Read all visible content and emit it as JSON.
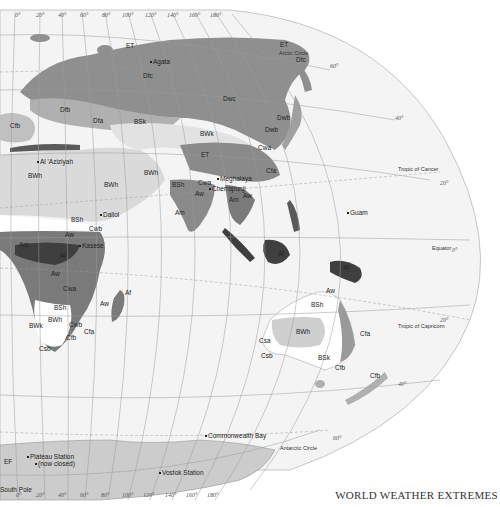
{
  "title": "WORLD WEATHER EXTREMES",
  "colors": {
    "ocean": "#f2f2f2",
    "graticule": "#9a9a9a",
    "D_cold": "#8f8f8f",
    "C_temperate": "#b9b9b9",
    "B_dry_hot": "#d9d9d9",
    "B_steppe": "#ffffff",
    "A_savanna": "#7a7a7a",
    "A_rainforest": "#3f3f3f",
    "E_polar": "#c8c8c8"
  },
  "graticule": {
    "top_longitudes": [
      "0°",
      "20°",
      "40°",
      "60°",
      "80°",
      "100°",
      "120°",
      "140°",
      "160°",
      "180°"
    ],
    "bottom_longitudes": [
      "0°",
      "20°",
      "40°",
      "60°",
      "80°",
      "100°",
      "120°",
      "140°",
      "160°",
      "180°"
    ],
    "latitudes": [
      "60°",
      "40°",
      "20°",
      "0°",
      "20°",
      "40°",
      "60°"
    ]
  },
  "reference_lines": {
    "arctic_circle": "Arctic Circle",
    "tropic_cancer": "Tropic of Cancer",
    "equator": "Equator",
    "tropic_capricorn": "Tropic of Capricorn",
    "antarctic_circle": "Antarctic Circle"
  },
  "climate_labels": [
    {
      "code": "ET",
      "x": 126,
      "y": 48
    },
    {
      "code": "ET",
      "x": 280,
      "y": 47
    },
    {
      "code": "Dfc",
      "x": 143,
      "y": 78
    },
    {
      "code": "Dfc",
      "x": 296,
      "y": 62
    },
    {
      "code": "Dwc",
      "x": 223,
      "y": 101
    },
    {
      "code": "Dwb",
      "x": 277,
      "y": 120
    },
    {
      "code": "Dwb",
      "x": 265,
      "y": 132
    },
    {
      "code": "Cwa",
      "x": 258,
      "y": 150
    },
    {
      "code": "Cfa",
      "x": 266,
      "y": 173
    },
    {
      "code": "Dfb",
      "x": 60,
      "y": 112
    },
    {
      "code": "Dfa",
      "x": 93,
      "y": 123
    },
    {
      "code": "BSk",
      "x": 134,
      "y": 124
    },
    {
      "code": "BWk",
      "x": 200,
      "y": 136
    },
    {
      "code": "Cfb",
      "x": 10,
      "y": 128
    },
    {
      "code": "BWh",
      "x": 28,
      "y": 178
    },
    {
      "code": "BWh",
      "x": 104,
      "y": 187
    },
    {
      "code": "BWh",
      "x": 144,
      "y": 175
    },
    {
      "code": "ET",
      "x": 201,
      "y": 157
    },
    {
      "code": "BSh",
      "x": 172,
      "y": 187
    },
    {
      "code": "Cwa",
      "x": 198,
      "y": 185
    },
    {
      "code": "Aw",
      "x": 195,
      "y": 196
    },
    {
      "code": "Aw",
      "x": 243,
      "y": 198
    },
    {
      "code": "Am",
      "x": 175,
      "y": 215
    },
    {
      "code": "Am",
      "x": 229,
      "y": 202
    },
    {
      "code": "BSh",
      "x": 71,
      "y": 222
    },
    {
      "code": "Aw",
      "x": 65,
      "y": 237
    },
    {
      "code": "Cwb",
      "x": 89,
      "y": 231
    },
    {
      "code": "Am",
      "x": 19,
      "y": 247
    },
    {
      "code": "Af",
      "x": 60,
      "y": 258
    },
    {
      "code": "Aw",
      "x": 51,
      "y": 276
    },
    {
      "code": "Cwa",
      "x": 63,
      "y": 291
    },
    {
      "code": "Af",
      "x": 125,
      "y": 295
    },
    {
      "code": "Aw",
      "x": 100,
      "y": 306
    },
    {
      "code": "BSh",
      "x": 54,
      "y": 310
    },
    {
      "code": "BWh",
      "x": 48,
      "y": 322
    },
    {
      "code": "BWk",
      "x": 29,
      "y": 328
    },
    {
      "code": "Cwb",
      "x": 69,
      "y": 327
    },
    {
      "code": "Cfa",
      "x": 84,
      "y": 334
    },
    {
      "code": "Cfb",
      "x": 66,
      "y": 340
    },
    {
      "code": "Csb",
      "x": 39,
      "y": 351
    },
    {
      "code": "Af",
      "x": 278,
      "y": 256
    },
    {
      "code": "Af",
      "x": 343,
      "y": 270
    },
    {
      "code": "Aw",
      "x": 326,
      "y": 293
    },
    {
      "code": "BSh",
      "x": 311,
      "y": 307
    },
    {
      "code": "BWh",
      "x": 296,
      "y": 334
    },
    {
      "code": "Csa",
      "x": 259,
      "y": 343
    },
    {
      "code": "Csb",
      "x": 261,
      "y": 358
    },
    {
      "code": "BSk",
      "x": 318,
      "y": 360
    },
    {
      "code": "Cfa",
      "x": 360,
      "y": 336
    },
    {
      "code": "Cfb",
      "x": 335,
      "y": 370
    },
    {
      "code": "Cfb",
      "x": 370,
      "y": 378
    },
    {
      "code": "EF",
      "x": 4,
      "y": 464
    }
  ],
  "places": [
    {
      "name": "Agata",
      "x": 153,
      "y": 64
    },
    {
      "name": "Al 'Aziziyah",
      "x": 40,
      "y": 164
    },
    {
      "name": "Meghalaya",
      "x": 220,
      "y": 181
    },
    {
      "name": "Cherrapunji",
      "x": 212,
      "y": 191
    },
    {
      "name": "Dallol",
      "x": 103,
      "y": 217
    },
    {
      "name": "Kasese",
      "x": 82,
      "y": 248
    },
    {
      "name": "Guam",
      "x": 350,
      "y": 215
    },
    {
      "name": "Commonwealth Bay",
      "x": 208,
      "y": 438
    },
    {
      "name": "Plateau Station",
      "x": 30,
      "y": 459
    },
    {
      "name": "(now closed)",
      "x": 38,
      "y": 466
    },
    {
      "name": "Vostok Station",
      "x": 162,
      "y": 475
    },
    {
      "name": "South Pole",
      "x": 0,
      "y": 492
    }
  ]
}
